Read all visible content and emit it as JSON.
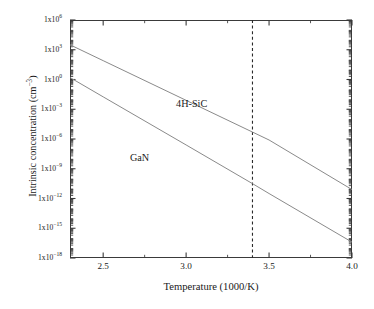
{
  "chart_data": {
    "type": "line",
    "title": "",
    "subtitle": "",
    "xlabel": "Temperature (1000/K)",
    "ylabel": "Intrinsic concentration (cm⁻³)",
    "xlim": [
      2.3,
      4.0
    ],
    "ylim_log10": [
      -18,
      6
    ],
    "xscale": "linear",
    "yscale": "log",
    "grid": false,
    "legend_position": "inline-annotations",
    "xticks": [
      2.5,
      3.0,
      3.5,
      4.0
    ],
    "xtick_labels": [
      "2.5",
      "3.0",
      "3.5",
      "4.0"
    ],
    "xminor_ticks": [
      2.75,
      3.25,
      3.75
    ],
    "yticks_log10": [
      6,
      3,
      0,
      -3,
      -6,
      -9,
      -12,
      -15,
      -18
    ],
    "ytick_labels": [
      {
        "mantissa": "1x10",
        "exponent": "6"
      },
      {
        "mantissa": "1x10",
        "exponent": "3"
      },
      {
        "mantissa": "1x10",
        "exponent": "0"
      },
      {
        "mantissa": "1x10",
        "exponent": "-3"
      },
      {
        "mantissa": "1x10",
        "exponent": "-6"
      },
      {
        "mantissa": "1x10",
        "exponent": "-9"
      },
      {
        "mantissa": "1x10",
        "exponent": "-12"
      },
      {
        "mantissa": "1x10",
        "exponent": "-15"
      },
      {
        "mantissa": "1x10",
        "exponent": "-18"
      }
    ],
    "series": [
      {
        "name": "4H-SiC",
        "color": "#8a8a8a",
        "x": [
          2.3,
          4.0
        ],
        "y_log10": [
          3.5,
          -11.1
        ],
        "points": [
          {
            "x": 2.3,
            "y_log10": 3.5
          },
          {
            "x": 2.5,
            "y_log10": 1.9
          },
          {
            "x": 3.0,
            "y_log10": -2.1
          },
          {
            "x": 3.4,
            "y_log10": -5.3
          },
          {
            "x": 3.5,
            "y_log10": -6.1
          },
          {
            "x": 4.0,
            "y_log10": -11.1
          }
        ]
      },
      {
        "name": "GaN",
        "color": "#8a8a8a",
        "x": [
          2.3,
          4.0
        ],
        "y_log10": [
          0.2,
          -16.4
        ],
        "points": [
          {
            "x": 2.3,
            "y_log10": 0.2
          },
          {
            "x": 2.5,
            "y_log10": -1.75
          },
          {
            "x": 3.0,
            "y_log10": -6.6
          },
          {
            "x": 3.4,
            "y_log10": -10.5
          },
          {
            "x": 3.5,
            "y_log10": -11.5
          },
          {
            "x": 4.0,
            "y_log10": -16.4
          }
        ]
      }
    ],
    "annotations": [
      {
        "name": "4H-SiC",
        "text": "4H-SiC",
        "x": 3.0,
        "y_log10": -2.6
      },
      {
        "name": "GaN",
        "text": "GaN",
        "x": 2.77,
        "y_log10": -8.0
      }
    ],
    "reference_lines": [
      {
        "name": "room-temperature-marker",
        "orientation": "vertical",
        "x": 3.4,
        "style": "dashed",
        "color": "#2a2a2a"
      }
    ],
    "axis_color": "#3a3a3a",
    "background": "#ffffff"
  }
}
